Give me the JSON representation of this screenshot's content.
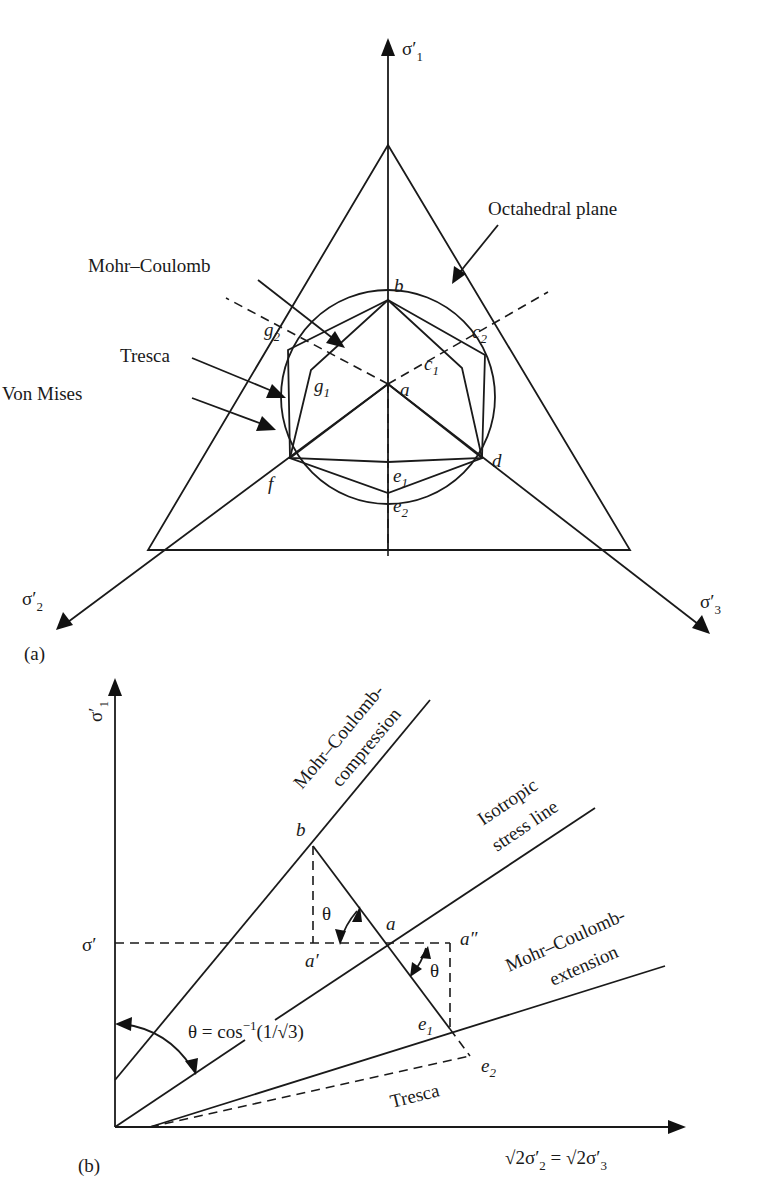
{
  "figure": {
    "panel_a": {
      "tag": "(a)",
      "axes": {
        "sigma1": {
          "base": "σ",
          "prime": "′",
          "sub": "1"
        },
        "sigma2": {
          "base": "σ",
          "prime": "′",
          "sub": "2"
        },
        "sigma3": {
          "base": "σ",
          "prime": "′",
          "sub": "3"
        }
      },
      "callouts": {
        "octahedral": "Octahedral plane",
        "mohr_coulomb": "Mohr–Coulomb",
        "tresca": "Tresca",
        "von_mises": "Von Mises"
      },
      "points": {
        "a": "a",
        "b": "b",
        "d": "d",
        "f": "f",
        "c": "c",
        "e": "e",
        "g": "g",
        "s1": "1",
        "s2": "2"
      }
    },
    "panel_b": {
      "tag": "(b)",
      "y_axis": {
        "base": "σ",
        "prime": "′",
        "sub": "1"
      },
      "x_axis": {
        "sqrt": "√2",
        "base": "σ",
        "prime": "′",
        "sub2": "2",
        "eq": " = ",
        "sub3": "3"
      },
      "sigma_prime": "σ′",
      "lines": {
        "mc_comp_1": "Mohr–Coulomb-",
        "mc_comp_2": "compression",
        "iso_1": "Isotropic",
        "iso_2": "stress line",
        "mc_ext_1": "Mohr–Coulomb-",
        "mc_ext_2": "extension",
        "tresca": "Tresca"
      },
      "angle_formula": {
        "theta": "θ",
        "eq": " = cos",
        "exp": "−1",
        "arg": "(1/√3)"
      },
      "theta": "θ",
      "points": {
        "a": "a",
        "a_prime": "a′",
        "a_dprime": "a″",
        "b": "b",
        "e": "e",
        "s1": "1",
        "s2": "2"
      }
    }
  }
}
